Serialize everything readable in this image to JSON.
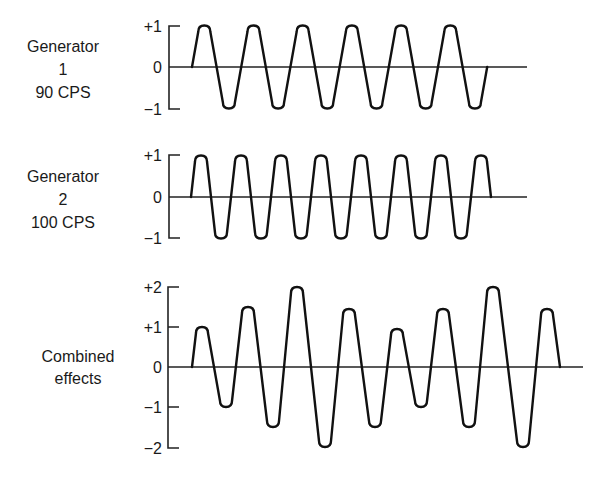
{
  "chart_data": [
    {
      "type": "line",
      "title": "Generator 1 90 CPS",
      "label_lines": [
        "Generator",
        "1",
        "90 CPS"
      ],
      "y_ticks": [
        "+1",
        "0",
        "-1"
      ],
      "ylim": [
        -1,
        1
      ],
      "frequency_cps": 90,
      "cycles": 6,
      "waveform": "sine",
      "peaks": [
        1,
        1,
        1,
        1,
        1,
        1
      ],
      "troughs": [
        -1,
        -1,
        -1,
        -1,
        -1,
        -1
      ]
    },
    {
      "type": "line",
      "title": "Generator 2 100 CPS",
      "label_lines": [
        "Generator",
        "2",
        "100 CPS"
      ],
      "y_ticks": [
        "+1",
        "0",
        "-1"
      ],
      "ylim": [
        -1,
        1
      ],
      "frequency_cps": 100,
      "cycles": 7.5,
      "waveform": "sine",
      "peaks": [
        1,
        1,
        1,
        1,
        1,
        1,
        1,
        1
      ],
      "troughs": [
        -1,
        -1,
        -1,
        -1,
        -1,
        -1,
        -1
      ]
    },
    {
      "type": "line",
      "title": "Combined effects",
      "label_lines": [
        "Combined",
        "effects"
      ],
      "y_ticks": [
        "+2",
        "+1",
        "0",
        "-1",
        "-2"
      ],
      "ylim": [
        -2,
        2
      ],
      "extrema": [
        {
          "x": 202,
          "v": 1.0
        },
        {
          "x": 226,
          "v": -1.0
        },
        {
          "x": 248,
          "v": 1.5
        },
        {
          "x": 273,
          "v": -1.5
        },
        {
          "x": 297,
          "v": 2.0
        },
        {
          "x": 325,
          "v": -2.0
        },
        {
          "x": 349,
          "v": 1.45
        },
        {
          "x": 375,
          "v": -1.5
        },
        {
          "x": 397,
          "v": 0.95
        },
        {
          "x": 421,
          "v": -1.0
        },
        {
          "x": 443,
          "v": 1.45
        },
        {
          "x": 469,
          "v": -1.5
        },
        {
          "x": 493,
          "v": 2.0
        },
        {
          "x": 523,
          "v": -2.0
        },
        {
          "x": 547,
          "v": 1.45
        }
      ]
    }
  ]
}
